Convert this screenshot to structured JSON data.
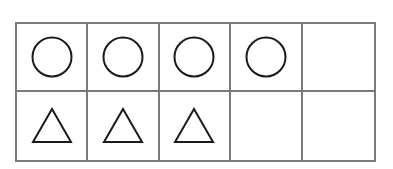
{
  "diagram": {
    "type": "ten-frame",
    "rows": 2,
    "cols": 5,
    "border_color": "#7a7a7a",
    "shape_stroke": "#1a1a1a",
    "cells": [
      [
        "circle",
        "circle",
        "circle",
        "circle",
        "empty"
      ],
      [
        "triangle",
        "triangle",
        "triangle",
        "empty",
        "empty"
      ]
    ],
    "counts": {
      "circle": 4,
      "triangle": 3,
      "empty": 3
    }
  }
}
